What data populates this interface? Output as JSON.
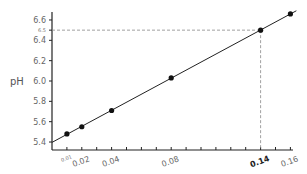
{
  "chart_data": {
    "type": "line",
    "title": "",
    "xlabel": "",
    "ylabel": "pH",
    "x": [
      0.01,
      0.02,
      0.04,
      0.08,
      0.14,
      0.16
    ],
    "series": [
      {
        "name": "pH",
        "values": [
          5.48,
          5.55,
          5.71,
          6.03,
          6.5,
          6.66
        ],
        "markers": true,
        "fit_line": true
      }
    ],
    "xlim": [
      0,
      0.16
    ],
    "ylim": [
      5.32,
      6.7
    ],
    "y_ticks": [
      5.4,
      5.6,
      5.8,
      6.0,
      6.2,
      6.4,
      6.6
    ],
    "y_tick_labels": [
      "5.4",
      "5.6",
      "5.8",
      "6.0",
      "6.2",
      "6.4",
      "6.6"
    ],
    "x_ticks": [
      0.01,
      0.02,
      0.04,
      0.08,
      0.14,
      0.16
    ],
    "x_tick_labels": [
      "0.01",
      "0.02",
      "0.04",
      "0.08",
      "0.14",
      "0.16"
    ],
    "annotations": [
      {
        "type": "reference",
        "x": 0.14,
        "y": 6.5,
        "x_label": "0.14",
        "y_label": "6.5",
        "style": "dashed"
      }
    ],
    "grid": false,
    "legend": "none"
  },
  "labels": {
    "ylabel": "pH",
    "ref_y": "6.5",
    "ref_x": "0.14"
  }
}
